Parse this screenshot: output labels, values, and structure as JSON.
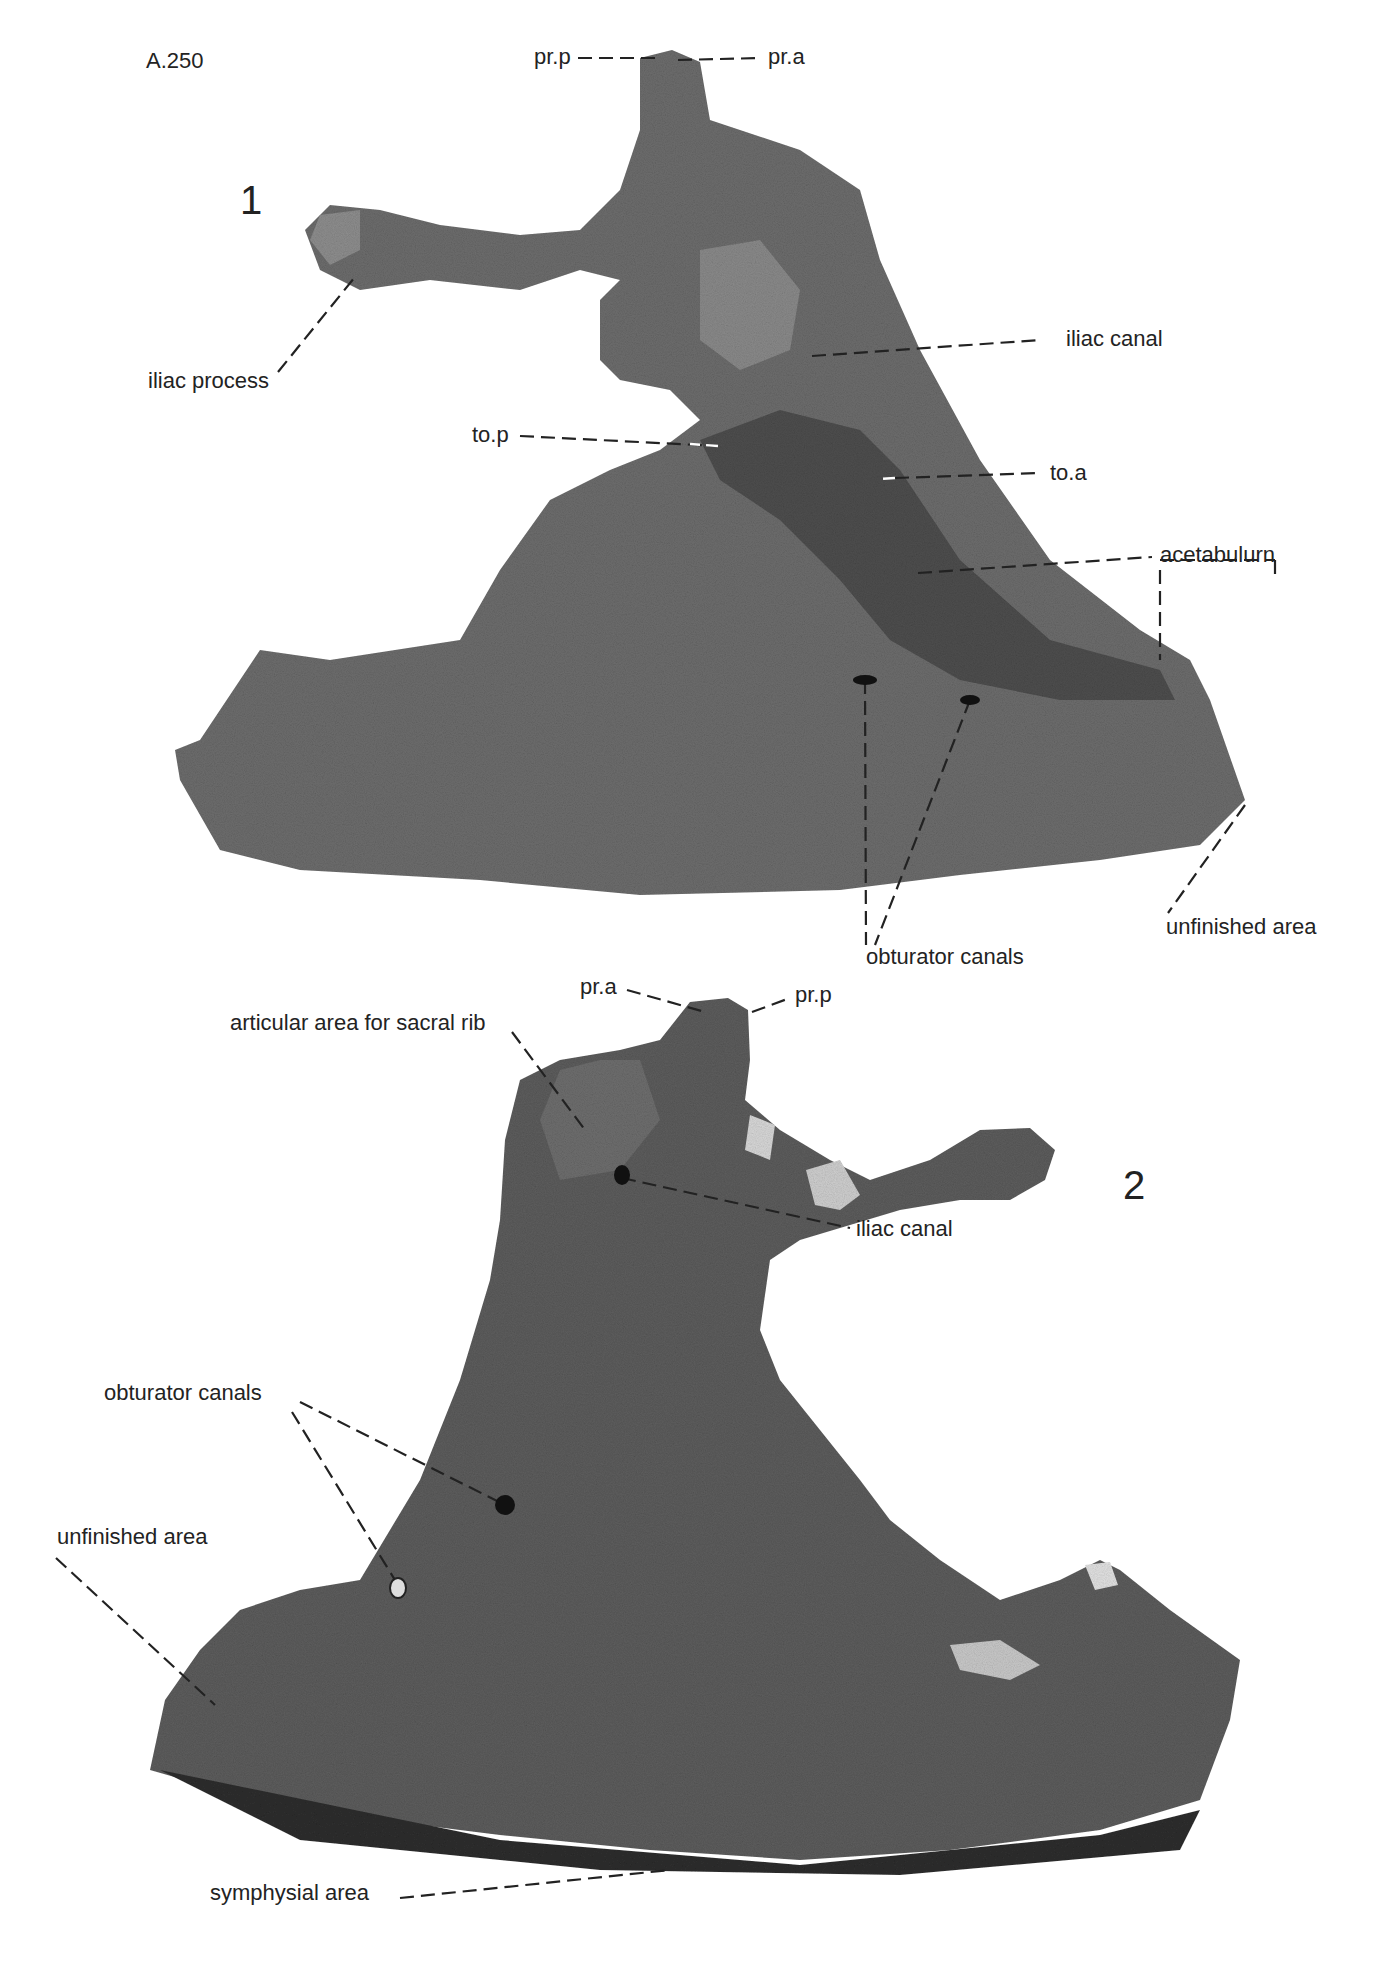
{
  "plate": {
    "specimen_id": "A.250",
    "figures": [
      {
        "number": "1",
        "labels": {
          "pr_p": "pr.p",
          "pr_a": "pr.a",
          "iliac_process": "iliac process",
          "iliac_canal": "iliac canal",
          "to_p": "to.p",
          "to_a": "to.a",
          "acetabulum": "acetabulurn",
          "obturator_canals": "obturator canals",
          "unfinished_area": "unfinished area"
        }
      },
      {
        "number": "2",
        "labels": {
          "pr_a": "pr.a",
          "pr_p": "pr.p",
          "articular_area": "articular area for sacral rib",
          "iliac_canal": "iliac canal",
          "obturator_canals": "obturator canals",
          "unfinished_area": "unfinished area",
          "symphysial_area": "symphysial area"
        }
      }
    ]
  }
}
